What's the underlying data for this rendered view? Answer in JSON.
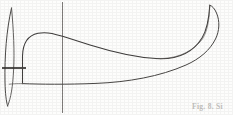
{
  "figure": {
    "caption": "Fig. 8. Si",
    "background_color": "#fdfdfc",
    "line_color": "#3f3d3c",
    "caption_color": "#b9b7b4",
    "width": 233,
    "height": 115,
    "elements": {
      "blade_outline_name": "blade-outline",
      "hub_lens_name": "hub-lens-shape",
      "reference_axis_name": "vertical-reference-axis",
      "tick_mark_name": "horizontal-tick-mark",
      "baseline_name": "blade-baseline"
    },
    "geometry": {
      "vertical_axis_x": 62.5,
      "vertical_axis_y_top": 2,
      "vertical_axis_y_bottom": 113,
      "tick_mark_y": 68,
      "tick_mark_x_start": 2,
      "tick_mark_x_end": 26,
      "baseline_y_left": 84,
      "baseline_y_right": 61,
      "blade_tip_x": 210,
      "blade_tip_y": 5,
      "top_curve_peak_x": 46,
      "top_curve_peak_y": 33,
      "lens_x": 9,
      "lens_y_top": 8,
      "lens_y_bottom": 106,
      "lens_max_width": 9,
      "left_edge_x": 22
    },
    "stroke_widths": {
      "outline": 1.0,
      "axis": 0.9,
      "tick": 1.6,
      "lens": 0.9
    }
  }
}
